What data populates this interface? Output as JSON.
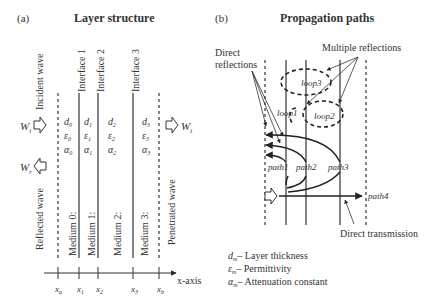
{
  "panel_a": {
    "tag": "(a)",
    "title": "Layer structure",
    "interfaces": [
      "Interface 1",
      "Interface 2",
      "Interface 3"
    ],
    "incident_wave": "Incident wave",
    "reflected_wave": "Reflected wave",
    "penetrated_wave": "Penetrated wave",
    "wi": "W",
    "wi_sub": "i",
    "wr": "W",
    "wr_sub": "r",
    "wt": "W",
    "wt_sub": "t",
    "media": [
      "Medium 0:",
      "Medium 1:",
      "Medium 2:",
      "Medium 3:"
    ],
    "params": [
      {
        "d": "d",
        "e": "ε",
        "a": "α",
        "sub": "0"
      },
      {
        "d": "d",
        "e": "ε",
        "a": "α",
        "sub": "1"
      },
      {
        "d": "d",
        "e": "ε",
        "a": "α",
        "sub": "2"
      },
      {
        "d": "d",
        "e": "ε",
        "a": "α",
        "sub": "3"
      }
    ],
    "axis_label": "x-axis",
    "ticks": [
      {
        "base": "x",
        "sub": "a"
      },
      {
        "base": "x",
        "sub": "1"
      },
      {
        "base": "x",
        "sub": "2"
      },
      {
        "base": "x",
        "sub": "3"
      },
      {
        "base": "x",
        "sub": "b"
      }
    ]
  },
  "panel_b": {
    "tag": "(b)",
    "title": "Propagation paths",
    "direct_reflections_1": "Direct",
    "direct_reflections_2": "reflections",
    "multiple_reflections": "Multiple reflections",
    "loops": [
      "loop1",
      "loop2",
      "loop3"
    ],
    "paths": [
      "path1",
      "path2",
      "path3",
      "path4"
    ],
    "direct_transmission": "Direct transmission"
  },
  "legend": [
    {
      "sym": "d",
      "sub": "m",
      "text": "– Layer thickness"
    },
    {
      "sym": "ε",
      "sub": "m",
      "text": "– Permittivity"
    },
    {
      "sym": "α",
      "sub": "m",
      "text": "– Attenuation constant"
    }
  ]
}
